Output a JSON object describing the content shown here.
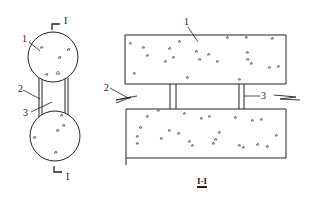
{
  "colors": {
    "stroke": "#222222",
    "fill": "#ffffff",
    "aggregate": "#444444"
  },
  "plan_view": {
    "section_mark_top": "I",
    "section_mark_bottom": "I",
    "labels": {
      "pile": "1",
      "side_member": "2",
      "strut": "3"
    }
  },
  "section_view": {
    "title": "I-I",
    "labels": {
      "slab": "1",
      "side_member": "2",
      "connector": "3"
    }
  }
}
